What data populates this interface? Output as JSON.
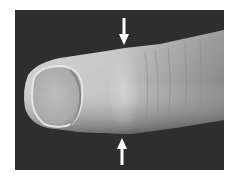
{
  "image": {
    "description": "Grayscale clinical photograph of a fingertip viewed from the dorsal side, with two white arrows pointing to a swelling on the finger",
    "colors": {
      "page_background": "#ffffff",
      "photo_background": "#2e2e2e",
      "skin_light": "#d8d8d8",
      "skin_mid": "#a8a8a8",
      "nail": "#b4b4b4",
      "arrow": "#ffffff"
    },
    "annotations": [
      {
        "type": "arrow",
        "direction": "down",
        "position": "top",
        "x": 124
      },
      {
        "type": "arrow",
        "direction": "up",
        "position": "bottom",
        "x": 122
      }
    ]
  }
}
